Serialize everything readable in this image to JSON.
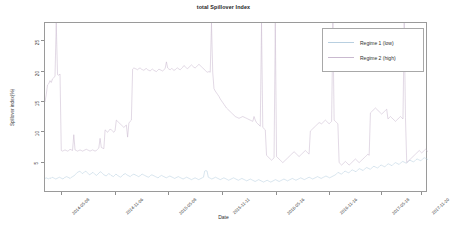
{
  "chart_data": {
    "type": "line",
    "title": "total Spillover Index",
    "xlabel": "Date",
    "ylabel": "Spillover index(%)",
    "ylim": [
      0,
      28
    ],
    "yticks": [
      5,
      10,
      15,
      20,
      25
    ],
    "ytick_labels": [
      "5",
      "10",
      "15",
      "20",
      "25"
    ],
    "grid": false,
    "legend_position": "top-right",
    "xtick_labels": [
      "2014-05-08",
      "2014-11-06",
      "2015-05-08",
      "2015-11-11",
      "2016-05-16",
      "2016-11-16",
      "2017-05-18",
      "2017-11-20"
    ],
    "xtick_positions": [
      0.045,
      0.185,
      0.325,
      0.465,
      0.605,
      0.745,
      0.88,
      0.985
    ],
    "colors": {
      "regime_1": "#b8cfe0",
      "regime_2": "#c9b9cf",
      "axis": "#9a9a9a",
      "text": "#2b2b2b"
    },
    "series": [
      {
        "name": "Regime 1 (low)",
        "color": "#b8cfe0",
        "values": [
          2.4,
          2.5,
          2.4,
          2.3,
          2.5,
          2.4,
          2.6,
          2.5,
          2.4,
          2.3,
          2.4,
          2.5,
          2.6,
          2.5,
          2.4,
          2.3,
          2.5,
          2.6,
          2.7,
          2.6,
          2.5,
          2.4,
          2.6,
          2.7,
          2.8,
          3.0,
          3.2,
          3.4,
          3.5,
          3.6,
          3.4,
          3.2,
          3.3,
          3.5,
          3.6,
          3.4,
          3.2,
          3.0,
          3.1,
          3.3,
          3.4,
          3.2,
          3.0,
          2.9,
          3.1,
          3.3,
          3.5,
          3.4,
          3.2,
          3.0,
          2.9,
          2.8,
          3.0,
          3.2,
          3.1,
          2.9,
          2.8,
          2.7,
          2.9,
          3.1,
          3.0,
          2.8,
          2.7,
          2.6,
          2.8,
          3.0,
          3.1,
          3.2,
          3.0,
          2.9,
          2.8,
          2.7,
          2.9,
          3.0,
          3.1,
          3.0,
          2.9,
          2.8,
          2.7,
          2.8,
          3.0,
          3.1,
          3.0,
          2.9,
          2.8,
          2.7,
          2.6,
          2.7,
          2.9,
          3.0,
          2.9,
          2.8,
          2.7,
          2.6,
          2.5,
          2.6,
          2.8,
          2.9,
          2.8,
          2.7,
          2.6,
          2.5,
          2.6,
          2.7,
          2.8,
          2.7,
          2.6,
          2.5,
          2.4,
          2.5,
          2.6,
          2.7,
          2.6,
          2.5,
          2.4,
          2.3,
          2.4,
          2.5,
          2.6,
          2.5,
          2.4,
          2.3,
          2.2,
          2.3,
          2.4,
          2.5,
          2.4,
          2.3,
          2.2,
          2.3,
          2.4,
          2.5,
          2.6,
          3.6,
          3.7,
          3.6,
          2.6,
          2.5,
          2.4,
          2.3,
          2.4,
          2.5,
          2.6,
          2.5,
          2.4,
          2.3,
          2.2,
          2.3,
          2.4,
          2.5,
          2.4,
          2.3,
          2.2,
          2.1,
          2.2,
          2.3,
          2.4,
          2.5,
          2.4,
          2.3,
          2.2,
          2.1,
          2.2,
          2.3,
          2.4,
          2.3,
          2.2,
          2.1,
          2.0,
          2.1,
          2.2,
          2.3,
          2.2,
          2.1,
          2.0,
          1.9,
          2.0,
          2.1,
          2.2,
          2.1,
          2.0,
          1.9,
          1.8,
          1.9,
          2.0,
          2.1,
          2.0,
          1.9,
          1.8,
          1.9,
          2.0,
          2.1,
          2.2,
          2.1,
          2.0,
          1.9,
          2.0,
          2.1,
          2.2,
          2.3,
          2.2,
          2.1,
          2.0,
          2.1,
          2.2,
          2.3,
          2.4,
          2.3,
          2.2,
          2.1,
          2.2,
          2.3,
          2.4,
          2.5,
          2.4,
          2.3,
          2.2,
          2.3,
          2.4,
          2.5,
          2.6,
          2.5,
          2.4,
          2.3,
          2.4,
          2.5,
          2.6,
          2.7,
          2.6,
          2.5,
          2.4,
          2.5,
          2.6,
          2.7,
          2.8,
          2.7,
          2.6,
          2.5,
          2.6,
          2.7,
          2.8,
          2.9,
          3.0,
          3.2,
          3.4,
          3.3,
          3.2,
          3.1,
          3.3,
          3.5,
          3.6,
          3.5,
          3.4,
          3.3,
          3.5,
          3.7,
          3.8,
          3.7,
          3.6,
          3.5,
          3.7,
          3.9,
          4.0,
          3.9,
          3.8,
          3.7,
          3.9,
          4.1,
          4.2,
          4.1,
          4.0,
          3.9,
          4.1,
          4.3,
          4.4,
          4.3,
          4.2,
          4.1,
          4.3,
          4.5,
          4.6,
          4.5,
          4.4,
          4.3,
          4.5,
          4.7,
          4.8,
          4.7,
          4.6,
          4.5,
          4.7,
          4.9,
          5.0,
          4.9,
          4.8,
          4.7,
          4.9,
          5.1,
          5.2,
          5.1,
          5.0,
          4.9,
          5.1,
          5.3,
          5.4,
          5.3,
          5.2,
          5.1,
          5.3,
          5.5,
          5.6,
          5.5,
          5.4,
          5.3,
          5.5,
          5.7,
          5.8,
          5.7,
          5.6,
          5.5
        ]
      },
      {
        "name": "Regime 2 (high)",
        "color": "#c9b9cf",
        "values": [
          15.0,
          16.2,
          17.8,
          18.0,
          18.5,
          18.2,
          18.8,
          19.0,
          19.2,
          28.0,
          19.5,
          19.4,
          19.6,
          7.0,
          6.9,
          7.0,
          7.1,
          7.0,
          6.9,
          7.0,
          7.2,
          7.1,
          7.0,
          9.6,
          7.1,
          7.0,
          6.9,
          7.0,
          7.1,
          7.0,
          6.9,
          7.0,
          7.1,
          7.2,
          7.1,
          7.0,
          6.9,
          7.0,
          7.1,
          7.0,
          6.9,
          7.0,
          7.2,
          7.4,
          9.0,
          7.5,
          7.4,
          7.3,
          10.4,
          10.2,
          10.0,
          10.3,
          10.5,
          10.4,
          10.2,
          10.0,
          10.3,
          12.0,
          11.8,
          11.6,
          11.4,
          11.2,
          11.0,
          10.8,
          11.0,
          11.2,
          9.2,
          11.5,
          11.8,
          12.0,
          20.4,
          20.6,
          20.5,
          20.4,
          20.3,
          20.5,
          20.6,
          20.4,
          20.3,
          20.2,
          20.4,
          20.5,
          20.3,
          20.2,
          20.1,
          20.3,
          20.4,
          20.2,
          20.1,
          20.0,
          20.2,
          20.4,
          20.3,
          20.2,
          20.1,
          20.3,
          20.5,
          21.6,
          20.6,
          20.4,
          20.3,
          20.5,
          20.4,
          20.2,
          20.3,
          20.5,
          20.6,
          20.4,
          20.3,
          20.5,
          20.7,
          21.0,
          20.8,
          20.6,
          20.5,
          20.7,
          20.9,
          21.1,
          20.9,
          20.7,
          20.6,
          20.8,
          21.0,
          21.2,
          21.0,
          20.8,
          20.6,
          20.4,
          20.2,
          20.0,
          19.9,
          20.0,
          19.9,
          28.0,
          19.9,
          17.2,
          16.8,
          16.5,
          16.2,
          15.9,
          15.5,
          15.2,
          14.9,
          14.6,
          14.3,
          14.0,
          13.8,
          13.6,
          13.4,
          13.2,
          13.0,
          12.8,
          12.6,
          12.5,
          12.4,
          12.3,
          12.4,
          12.5,
          12.6,
          12.5,
          12.4,
          12.3,
          12.2,
          12.1,
          12.0,
          11.9,
          11.8,
          12.6,
          12.0,
          11.6,
          11.4,
          11.2,
          11.0,
          28.0,
          10.8,
          10.6,
          10.4,
          6.2,
          6.0,
          5.8,
          5.6,
          5.4,
          5.6,
          5.8,
          28.0,
          6.0,
          5.8,
          5.6,
          5.4,
          5.2,
          5.0,
          5.2,
          5.4,
          5.6,
          5.8,
          6.0,
          6.2,
          6.4,
          6.6,
          6.8,
          6.6,
          6.4,
          6.2,
          6.0,
          6.2,
          6.4,
          6.6,
          6.8,
          7.0,
          6.8,
          6.6,
          6.4,
          10.2,
          10.4,
          10.6,
          10.8,
          11.0,
          11.2,
          11.4,
          11.6,
          11.5,
          11.4,
          11.6,
          11.8,
          12.0,
          11.8,
          11.6,
          11.4,
          11.6,
          11.8,
          28.0,
          12.0,
          11.8,
          11.6,
          11.4,
          5.0,
          4.8,
          4.6,
          4.8,
          5.0,
          5.2,
          5.0,
          4.8,
          4.6,
          4.8,
          5.0,
          5.2,
          5.4,
          5.6,
          5.4,
          5.2,
          5.0,
          5.2,
          5.4,
          5.6,
          5.8,
          6.0,
          6.2,
          6.4,
          6.2,
          13.2,
          13.4,
          13.6,
          13.8,
          14.0,
          13.8,
          13.6,
          13.4,
          13.2,
          13.0,
          13.2,
          13.4,
          13.6,
          13.8,
          12.2,
          12.4,
          12.6,
          12.4,
          12.2,
          12.0,
          11.8,
          12.0,
          12.2,
          12.4,
          12.6,
          12.4,
          12.2,
          28.0,
          12.4,
          5.0,
          5.2,
          5.4,
          5.6,
          5.8,
          6.0,
          6.2,
          6.4,
          6.6,
          6.8,
          7.0,
          6.8,
          6.6,
          6.8,
          7.0,
          7.2,
          7.0,
          6.8
        ]
      }
    ]
  }
}
